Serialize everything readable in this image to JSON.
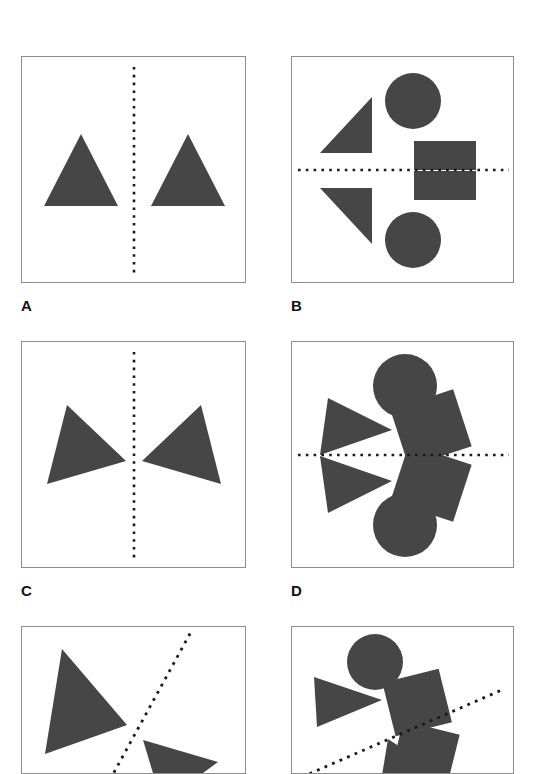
{
  "figure": {
    "background_color": "#ffffff",
    "shape_fill_color": "#464646",
    "axis_color": "#1a1a1a",
    "panel_border_color": "#8d8d8d",
    "axis_style": "dotted",
    "panel_count": 6,
    "visible_labels": [
      "A",
      "B",
      "C",
      "D"
    ]
  },
  "panels": [
    {
      "id": "a",
      "label": "A",
      "axis_orientation": "vertical",
      "element_count": 2,
      "element_types": [
        "triangle",
        "triangle"
      ],
      "symmetry": "translation",
      "shapes": [
        {
          "type": "triangle",
          "points": "22,149 59,77 96,149"
        },
        {
          "type": "triangle",
          "points": "129,149 166,77 203,149"
        }
      ],
      "axis": {
        "x1": 112,
        "y1": 10,
        "x2": 112,
        "y2": 217
      }
    },
    {
      "id": "b",
      "label": "B",
      "axis_orientation": "horizontal",
      "element_count": 6,
      "element_types": [
        "circle",
        "triangle",
        "square",
        "circle",
        "triangle",
        "square"
      ],
      "symmetry": "mirror",
      "shapes": [
        {
          "type": "circle",
          "cx": 121,
          "cy": 44,
          "r": 28
        },
        {
          "type": "triangle",
          "points": "28,96 80,96 80,40"
        },
        {
          "type": "square",
          "x": 122,
          "y": 84,
          "w": 62,
          "h": 29
        },
        {
          "type": "circle",
          "cx": 121,
          "cy": 183,
          "r": 28
        },
        {
          "type": "triangle",
          "points": "28,131 80,131 80,187"
        },
        {
          "type": "square",
          "x": 122,
          "y": 114,
          "w": 62,
          "h": 29
        }
      ],
      "axis": {
        "x1": 6,
        "y1": 113,
        "x2": 217,
        "y2": 113
      }
    },
    {
      "id": "c",
      "label": "C",
      "axis_orientation": "vertical",
      "element_count": 2,
      "element_types": [
        "triangle",
        "triangle"
      ],
      "symmetry": "mirror",
      "shapes": [
        {
          "type": "triangle",
          "points": "45,63 104,119 25,142"
        },
        {
          "type": "triangle",
          "points": "179,63 120,119 199,142"
        }
      ],
      "axis": {
        "x1": 112,
        "y1": 10,
        "x2": 112,
        "y2": 217
      }
    },
    {
      "id": "d",
      "label": "D",
      "axis_orientation": "horizontal",
      "element_count": 6,
      "element_types": [
        "circle",
        "triangle",
        "square",
        "circle",
        "triangle",
        "square"
      ],
      "symmetry": "mirror-rotated",
      "shapes": [
        {
          "type": "circle",
          "cx": 113,
          "cy": 44,
          "r": 32
        },
        {
          "type": "triangle",
          "points": "36,56 100,88 28,113"
        },
        {
          "type": "square",
          "x": 106,
          "y": 56,
          "w": 66,
          "h": 60,
          "rotate": -18
        },
        {
          "type": "circle",
          "cx": 113,
          "cy": 183,
          "r": 32
        },
        {
          "type": "triangle",
          "points": "36,171 100,139 28,114"
        },
        {
          "type": "square",
          "x": 106,
          "y": 111,
          "w": 66,
          "h": 60,
          "rotate": 18
        }
      ],
      "axis": {
        "x1": 6,
        "y1": 113,
        "x2": 217,
        "y2": 113
      }
    },
    {
      "id": "e",
      "label": "",
      "axis_orientation": "oblique",
      "element_count": 2,
      "element_types": [
        "triangle",
        "triangle"
      ],
      "symmetry": "mirror",
      "cropped": true,
      "shapes": [
        {
          "type": "triangle",
          "points": "40,22 105,98 23,127"
        },
        {
          "type": "triangle",
          "points": "121,113 196,135 140,176"
        }
      ],
      "axis": {
        "x1": 84,
        "y1": 160,
        "x2": 170,
        "y2": 3
      }
    },
    {
      "id": "f",
      "label": "",
      "axis_orientation": "oblique",
      "element_count": 6,
      "element_types": [
        "circle",
        "triangle",
        "square",
        "circle",
        "triangle",
        "square"
      ],
      "symmetry": "mirror-rotated",
      "cropped": true,
      "shapes": [
        {
          "type": "circle",
          "cx": 83,
          "cy": 35,
          "r": 28
        },
        {
          "type": "triangle",
          "points": "22,50 90,73 25,100"
        },
        {
          "type": "square",
          "x": 96,
          "y": 48,
          "w": 58,
          "h": 55,
          "rotate": -14
        },
        {
          "type": "triangle",
          "points": "96,112 148,146 88,160"
        },
        {
          "type": "square",
          "x": 104,
          "y": 100,
          "w": 58,
          "h": 55,
          "rotate": 14
        },
        {
          "type": "circle",
          "cx": 110,
          "cy": 168,
          "r": 28
        }
      ],
      "axis": {
        "x1": 10,
        "y1": 150,
        "x2": 212,
        "y2": 62
      }
    }
  ]
}
